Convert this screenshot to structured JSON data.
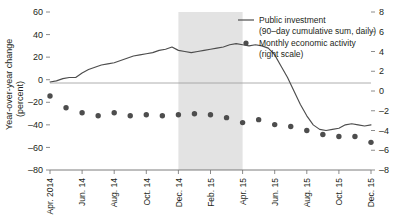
{
  "chart_data": {
    "type": "line",
    "title": "",
    "subtitle": "",
    "ylabel": "Year-over-year change\n(percent)",
    "ylabel_line1": "Year-over-year change",
    "ylabel_line2": "(percent)",
    "xlabel": "",
    "ylim": [
      -80,
      60
    ],
    "y2lim": [
      -8,
      8
    ],
    "grid": false,
    "zero_line": true,
    "legend_position": "top-right",
    "y_ticks": [
      60,
      40,
      20,
      0,
      -20,
      -40,
      -60,
      -80
    ],
    "y_tick_labels": [
      "60",
      "40",
      "20",
      "0",
      "–20",
      "–40",
      "–60",
      "–80"
    ],
    "y2_ticks": [
      8,
      6,
      4,
      2,
      0,
      -2,
      -4,
      -6,
      -8
    ],
    "y2_tick_labels": [
      "8",
      "6",
      "4",
      "2",
      "0",
      "–2",
      "–4",
      "–6",
      "–8"
    ],
    "x_tick_labels": [
      "Apr. 2014",
      "Jun. 14",
      "Aug. 14",
      "Oct. 14",
      "Dec. 14",
      "Feb. 15",
      "Apr. 15",
      "Jun. 15",
      "Aug. 15",
      "Oct. 15",
      "Dec. 15"
    ],
    "shaded_band": {
      "start_label": "Dec. 14",
      "end_label": "Apr. 15",
      "color": "#e3e3e3"
    },
    "series": [
      {
        "name": "Public investment",
        "sublabel": "(90–day cumulative sum, daily)",
        "type": "line",
        "axis": "left",
        "color": "#4d4d4d",
        "x": [
          0.0,
          0.4,
          0.8,
          1.2,
          1.6,
          2.0,
          2.4,
          2.8,
          3.2,
          3.6,
          4.0,
          4.4,
          4.8,
          5.2,
          5.6,
          6.0,
          6.4,
          6.8,
          7.2,
          7.6,
          8.0,
          8.4,
          8.8,
          9.2,
          9.6,
          10.0,
          10.4,
          10.8,
          11.2,
          11.6,
          12.0,
          12.4,
          12.8,
          13.2,
          13.6,
          14.0,
          14.4,
          14.8,
          15.2,
          15.6,
          16.0,
          16.4,
          16.8,
          17.2,
          17.6,
          18.0,
          18.4,
          18.8,
          19.2,
          19.6,
          20.0
        ],
        "values": [
          -2,
          -1,
          1,
          2,
          2,
          6,
          9,
          11,
          13,
          14,
          15,
          17,
          19,
          21,
          22,
          23,
          24,
          26,
          27,
          29,
          26,
          25,
          24,
          25,
          26,
          27,
          28,
          29,
          31,
          32,
          31,
          30,
          31,
          30,
          28,
          22,
          12,
          2,
          -10,
          -22,
          -32,
          -40,
          -44,
          -45,
          -44,
          -43,
          -40,
          -39,
          -40,
          -41,
          -40
        ]
      },
      {
        "name": "Monthly economic activity",
        "sublabel": "(right scale)",
        "type": "scatter",
        "axis": "right",
        "color": "#4d4d4d",
        "x": [
          0.0,
          1.0,
          2.0,
          3.0,
          4.0,
          5.0,
          6.0,
          7.0,
          8.0,
          9.0,
          10.0,
          11.0,
          12.0,
          13.0,
          14.0,
          15.0,
          16.0,
          17.0,
          18.0,
          19.0,
          20.0
        ],
        "values": [
          -0.5,
          -1.7,
          -2.2,
          -2.5,
          -2.2,
          -2.5,
          -2.4,
          -2.5,
          -2.4,
          -2.3,
          -2.4,
          -2.7,
          -3.2,
          -2.9,
          -3.4,
          -3.6,
          -4.0,
          -4.4,
          -4.6,
          -4.6,
          -5.2
        ]
      }
    ]
  },
  "legend": {
    "line_entry": "Public investment",
    "line_entry_sub": "(90–day cumulative sum, daily)",
    "dot_entry": "Monthly economic activity",
    "dot_entry_sub": "(right scale)"
  },
  "axis": {
    "left_title_line1": "Year-over-year change",
    "left_title_line2": "(percent)"
  }
}
